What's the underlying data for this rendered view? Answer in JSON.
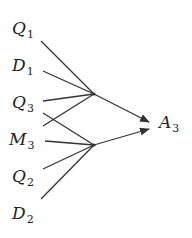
{
  "diagram": {
    "inputs": [
      {
        "id": "Q1",
        "letter": "Q",
        "sub": "1",
        "x": 12,
        "y": 20
      },
      {
        "id": "D1",
        "letter": "D",
        "sub": "1",
        "x": 12,
        "y": 57
      },
      {
        "id": "Q3",
        "letter": "Q",
        "sub": "3",
        "x": 12,
        "y": 94
      },
      {
        "id": "M3",
        "letter": "M",
        "sub": "3",
        "x": 9,
        "y": 131
      },
      {
        "id": "Q2",
        "letter": "Q",
        "sub": "2",
        "x": 12,
        "y": 168
      },
      {
        "id": "D2",
        "letter": "D",
        "sub": "2",
        "x": 12,
        "y": 205
      }
    ],
    "output": {
      "id": "A3",
      "letter": "A",
      "sub": "3",
      "x": 159,
      "y": 114
    },
    "junctions": [
      {
        "name": "upper",
        "x": 94,
        "y": 94
      },
      {
        "name": "lower",
        "x": 94,
        "y": 145
      }
    ],
    "edges": [
      {
        "from": "Q1",
        "x1": 41,
        "y1": 41,
        "to": "upper"
      },
      {
        "from": "D1",
        "x1": 43,
        "y1": 71,
        "to": "upper"
      },
      {
        "from": "Q3",
        "x1": 43,
        "y1": 101,
        "to": "upper"
      },
      {
        "from": "M3-cross",
        "x1": 43,
        "y1": 126,
        "to": "upper"
      },
      {
        "from": "Q3-cross",
        "x1": 43,
        "y1": 113,
        "to": "lower"
      },
      {
        "from": "M3",
        "x1": 45,
        "y1": 141,
        "to": "lower"
      },
      {
        "from": "Q2",
        "x1": 43,
        "y1": 169,
        "to": "lower"
      },
      {
        "from": "D2",
        "x1": 41,
        "y1": 199,
        "to": "lower"
      }
    ],
    "arrows": [
      {
        "from": "upper",
        "x2": 149,
        "y2": 122
      },
      {
        "from": "lower",
        "x2": 149,
        "y2": 129
      }
    ],
    "colors": {
      "stroke": "#333333",
      "text": "#222222",
      "background": "#ffffff"
    }
  }
}
